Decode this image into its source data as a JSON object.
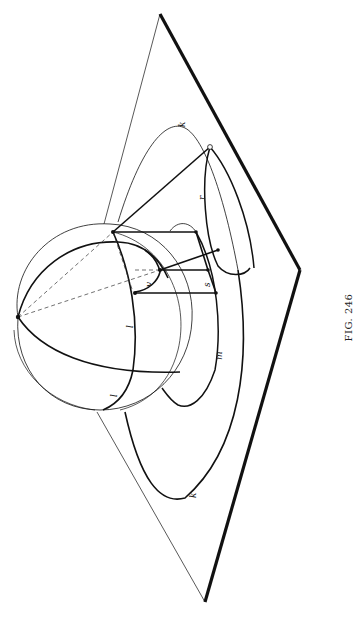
{
  "figure": {
    "caption": "FIG. 246",
    "orientation": "rotated 90° counter-clockwise",
    "background": "#ffffff",
    "ink_color": "#111111"
  },
  "labels": {
    "k_top": "k",
    "r": "r",
    "v": "v",
    "s": "s",
    "m": "m",
    "l_upper": "l",
    "l_lower": "l",
    "k_bottom": "k"
  },
  "elements": {
    "plane": "plane",
    "sphere": "sphere",
    "pole_point": "pole",
    "dashed_lines": "construction-lines"
  }
}
